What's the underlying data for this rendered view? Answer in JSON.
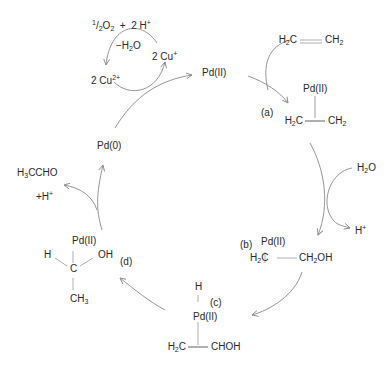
{
  "colors": {
    "text": "#2a2a2a",
    "arrow": "#8a8a8a",
    "bond": "#b0b0b0",
    "background": "#ffffff"
  },
  "copper_cycle": {
    "oxidant": {
      "half": "1",
      "over": "2",
      "o2": "O",
      "o2_sub": "2",
      "plus": "+",
      "h": "2 H",
      "h_sup": "+"
    },
    "water_loss": {
      "pre": "−H",
      "sub": "2",
      "post": "O"
    },
    "cu_plus": {
      "pre": "2 Cu",
      "sup": "+"
    },
    "cu_2plus": {
      "pre": "2 Cu",
      "sup": "2+"
    }
  },
  "species": {
    "pd_ii_top": "Pd(II)",
    "pd_0": "Pd(0)",
    "ethylene": {
      "left": "H",
      "left_sub": "2",
      "left_c": "C",
      "right": "CH",
      "right_sub": "2"
    },
    "complex_a": {
      "metal": "Pd(II)",
      "left": "H",
      "left_sub": "2",
      "left_c": "C",
      "right": "CH",
      "right_sub": "2"
    },
    "water": {
      "h": "H",
      "sub": "2",
      "o": "O"
    },
    "proton": {
      "h": "H",
      "sup": "+"
    },
    "complex_b": {
      "metal": "Pd(II)",
      "left": "H",
      "left_sub": "2",
      "left_c": "C",
      "right": "CH",
      "right_sub": "2",
      "right_oh": "OH"
    },
    "complex_c": {
      "hydride": "H",
      "metal": "Pd(II)",
      "left": "H",
      "left_sub": "2",
      "left_c": "C",
      "right": "CHOH"
    },
    "complex_d": {
      "metal": "Pd(II)",
      "h": "H",
      "c": "C",
      "oh": "OH",
      "ch3": "CH",
      "ch3_sub": "3"
    },
    "acetaldehyde": {
      "h3": "H",
      "sub": "3",
      "rest": "CCHO"
    },
    "proton_release": {
      "pre": "+H",
      "sup": "+"
    }
  },
  "step_labels": {
    "a": "(a)",
    "b": "(b)",
    "c": "(c)",
    "d": "(d)"
  }
}
